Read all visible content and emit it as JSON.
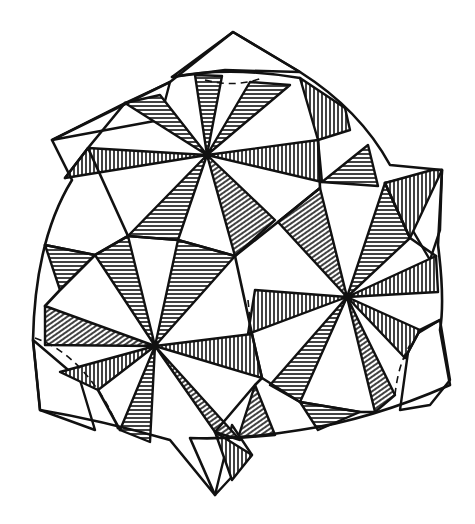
{
  "figure": {
    "title": "",
    "colors": {
      "ink": "#111111",
      "background": "#ffffff"
    },
    "star_centers": [
      {
        "name": "top",
        "x": 207,
        "y": 155
      },
      {
        "name": "right",
        "x": 347,
        "y": 297
      },
      {
        "name": "left",
        "x": 155,
        "y": 346
      }
    ],
    "hatch_styles": [
      "horizontal",
      "vertical",
      "diagonal"
    ]
  }
}
